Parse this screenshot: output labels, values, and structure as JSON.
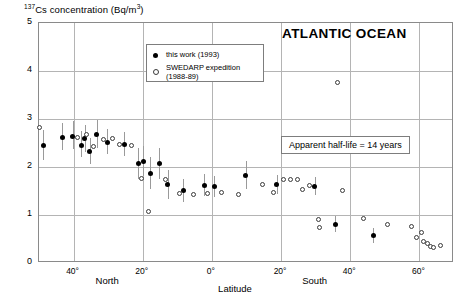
{
  "chart_data": {
    "type": "scatter",
    "title": "ATLANTIC OCEAN",
    "ylabel_html": "137Cs concentration (Bq/m3)",
    "ylabel_prefix": "Cs concentration (Bq/m",
    "ylabel_sup_left": "137",
    "ylabel_sup_right": "3",
    "ylabel_suffix": ")",
    "xlabel": "Latitude",
    "xlim": [
      50,
      -70
    ],
    "ylim": [
      0,
      5
    ],
    "grid": true,
    "y_ticks": [
      0,
      1,
      2,
      3,
      4,
      5
    ],
    "y_tick_labels": [
      "0",
      "1",
      "2",
      "3",
      "4",
      "5"
    ],
    "x_ticks": [
      40,
      20,
      0,
      -20,
      -40,
      -60
    ],
    "x_tick_labels": [
      "40°",
      "20°",
      "0°",
      "20°",
      "40°",
      "60°"
    ],
    "x_hemisphere_labels": [
      "North",
      "South"
    ],
    "annotation": "Apparent half-life = 14 years",
    "legend_position": "upper-center",
    "series": [
      {
        "name": "this work (1993)",
        "marker": "filled-circle",
        "points": [
          {
            "lat": 48.5,
            "value": 2.43,
            "err_low": 2.12,
            "err_high": 2.76
          },
          {
            "lat": 43.0,
            "value": 2.6,
            "err_low": 2.33,
            "err_high": 2.9
          },
          {
            "lat": 40.0,
            "value": 2.62,
            "err_low": 2.35,
            "err_high": 2.93
          },
          {
            "lat": 37.5,
            "value": 2.43,
            "err_low": 2.18,
            "err_high": 2.72
          },
          {
            "lat": 36.5,
            "value": 2.58,
            "err_low": 2.3,
            "err_high": 2.86
          },
          {
            "lat": 35.0,
            "value": 2.3,
            "err_low": 2.05,
            "err_high": 2.58
          },
          {
            "lat": 33.0,
            "value": 2.65,
            "err_low": 2.38,
            "err_high": 2.95
          },
          {
            "lat": 30.0,
            "value": 2.5,
            "err_low": 2.25,
            "err_high": 2.78
          },
          {
            "lat": 25.0,
            "value": 2.45,
            "err_low": 2.2,
            "err_high": 2.7
          },
          {
            "lat": 21.0,
            "value": 2.05,
            "err_low": 1.72,
            "err_high": 2.38
          },
          {
            "lat": 19.5,
            "value": 2.1,
            "err_low": 1.8,
            "err_high": 2.42
          },
          {
            "lat": 17.5,
            "value": 1.85,
            "err_low": 1.52,
            "err_high": 2.18
          },
          {
            "lat": 15.0,
            "value": 2.05,
            "err_low": 1.72,
            "err_high": 2.38
          },
          {
            "lat": 12.5,
            "value": 1.62,
            "err_low": 1.32,
            "err_high": 1.92
          },
          {
            "lat": 8.0,
            "value": 1.48,
            "err_low": 1.25,
            "err_high": 1.72
          },
          {
            "lat": 2.0,
            "value": 1.6,
            "err_low": 1.38,
            "err_high": 1.84
          },
          {
            "lat": -1.0,
            "value": 1.58,
            "err_low": 1.35,
            "err_high": 1.8
          },
          {
            "lat": -10.0,
            "value": 1.8,
            "err_low": 1.52,
            "err_high": 2.1
          },
          {
            "lat": -19.0,
            "value": 1.62,
            "err_low": 1.42,
            "err_high": 1.82
          },
          {
            "lat": -30.0,
            "value": 1.58,
            "err_low": 1.4,
            "err_high": 1.78
          },
          {
            "lat": -36.0,
            "value": 0.78,
            "err_low": 0.62,
            "err_high": 0.95
          },
          {
            "lat": -47.0,
            "value": 0.55,
            "err_low": 0.4,
            "err_high": 0.7
          }
        ]
      },
      {
        "name": "SWEDARP expedition (1988-89)",
        "marker": "open-circle",
        "points": [
          {
            "lat": 49.5,
            "value": 2.8
          },
          {
            "lat": 38.5,
            "value": 2.6
          },
          {
            "lat": 36.0,
            "value": 2.65
          },
          {
            "lat": 34.0,
            "value": 2.4
          },
          {
            "lat": 31.0,
            "value": 2.55
          },
          {
            "lat": 28.5,
            "value": 2.58
          },
          {
            "lat": 26.5,
            "value": 2.45
          },
          {
            "lat": 23.0,
            "value": 2.42
          },
          {
            "lat": 20.0,
            "value": 1.75
          },
          {
            "lat": 18.0,
            "value": 1.05
          },
          {
            "lat": 13.0,
            "value": 1.72
          },
          {
            "lat": 9.0,
            "value": 1.42
          },
          {
            "lat": 5.0,
            "value": 1.4
          },
          {
            "lat": 1.0,
            "value": 1.42
          },
          {
            "lat": -3.0,
            "value": 1.45
          },
          {
            "lat": -8.0,
            "value": 1.4
          },
          {
            "lat": -15.0,
            "value": 1.62
          },
          {
            "lat": -18.0,
            "value": 1.45
          },
          {
            "lat": -21.0,
            "value": 1.72
          },
          {
            "lat": -23.0,
            "value": 1.72
          },
          {
            "lat": -25.0,
            "value": 1.72
          },
          {
            "lat": -26.5,
            "value": 1.52
          },
          {
            "lat": -28.5,
            "value": 1.6
          },
          {
            "lat": -36.5,
            "value": 3.75
          },
          {
            "lat": -38.0,
            "value": 1.48
          },
          {
            "lat": -31.0,
            "value": 0.88
          },
          {
            "lat": -31.5,
            "value": 0.72
          },
          {
            "lat": -44.0,
            "value": 0.9
          },
          {
            "lat": -51.0,
            "value": 0.78
          },
          {
            "lat": -58.0,
            "value": 0.75
          },
          {
            "lat": -59.5,
            "value": 0.52
          },
          {
            "lat": -61.0,
            "value": 0.62
          },
          {
            "lat": -61.5,
            "value": 0.42
          },
          {
            "lat": -62.5,
            "value": 0.38
          },
          {
            "lat": -63.5,
            "value": 0.33
          },
          {
            "lat": -64.5,
            "value": 0.3
          },
          {
            "lat": -66.5,
            "value": 0.35
          }
        ]
      }
    ]
  }
}
